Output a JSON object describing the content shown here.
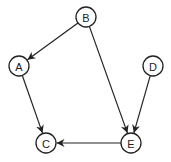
{
  "diagram": {
    "type": "directed-graph",
    "node_radius": 10,
    "colors": {
      "stroke": "#222222",
      "fill": "#ffffff",
      "background": "#ffffff"
    },
    "nodes": [
      {
        "id": "A",
        "label": "A",
        "x": 19,
        "y": 66
      },
      {
        "id": "B",
        "label": "B",
        "x": 86,
        "y": 17
      },
      {
        "id": "C",
        "label": "C",
        "x": 46,
        "y": 143
      },
      {
        "id": "D",
        "label": "D",
        "x": 153,
        "y": 66
      },
      {
        "id": "E",
        "label": "E",
        "x": 131,
        "y": 143
      }
    ],
    "edges": [
      {
        "from": "B",
        "to": "A"
      },
      {
        "from": "B",
        "to": "E"
      },
      {
        "from": "A",
        "to": "C"
      },
      {
        "from": "D",
        "to": "E"
      },
      {
        "from": "E",
        "to": "C"
      }
    ]
  }
}
